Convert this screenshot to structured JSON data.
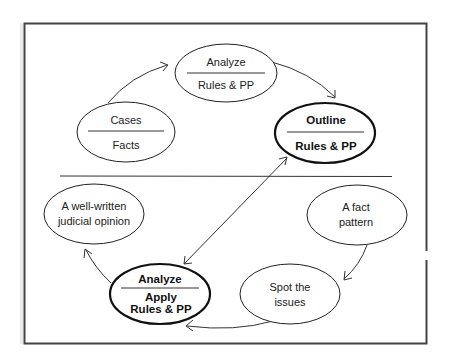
{
  "diagram": {
    "colors": {
      "stroke": "#222222",
      "frame": "#444444",
      "background": "#ffffff"
    },
    "nodes": {
      "analyze_rules": {
        "top": "Analyze",
        "bottom": "Rules & PP",
        "emphasis": false
      },
      "cases_facts": {
        "top": "Cases",
        "bottom": "Facts",
        "emphasis": false
      },
      "outline_rules": {
        "top": "Outline",
        "bottom": "Rules & PP",
        "emphasis": true
      },
      "judicial_opinion": {
        "line1": "A well-written",
        "line2": "judicial opinion",
        "emphasis": false
      },
      "fact_pattern": {
        "line1": "A fact",
        "line2": "pattern",
        "emphasis": false
      },
      "spot_issues": {
        "line1": "Spot the",
        "line2": "issues",
        "emphasis": false
      },
      "analyze_apply": {
        "top": "Analyze",
        "bottom1": "Apply",
        "bottom2": "Rules & PP",
        "emphasis": true
      }
    },
    "edges": [
      {
        "from": "Cases / Facts",
        "to": "Analyze / Rules & PP"
      },
      {
        "from": "Analyze / Rules & PP",
        "to": "Outline / Rules & PP"
      },
      {
        "from": "Outline / Rules & PP",
        "to": "Analyze / Apply Rules & PP",
        "bidirectional": true
      },
      {
        "from": "A fact pattern",
        "to": "Spot the issues"
      },
      {
        "from": "Spot the issues",
        "to": "Analyze / Apply Rules & PP"
      },
      {
        "from": "Analyze / Apply Rules & PP",
        "to": "A well-written judicial opinion"
      }
    ]
  }
}
